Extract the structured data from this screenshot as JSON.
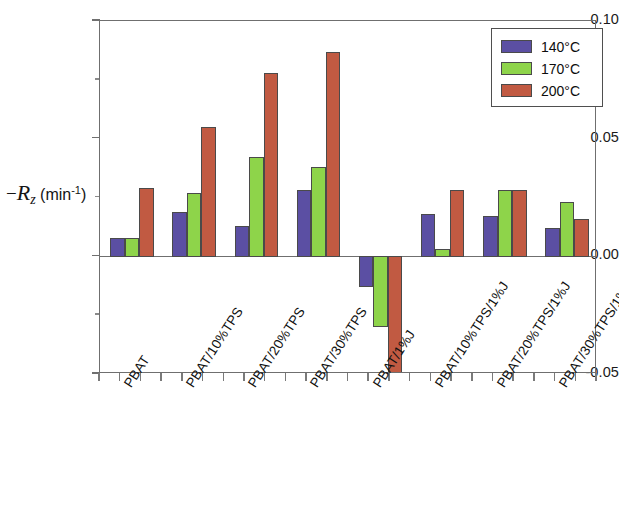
{
  "chart_data": {
    "type": "bar",
    "title": "",
    "xlabel": "",
    "ylabel": "−R_z (min⁻¹)",
    "ylim": [
      -0.05,
      0.1
    ],
    "yticks": [
      -0.05,
      0.0,
      0.05,
      0.1
    ],
    "ytick_labels": [
      "-0.05",
      "0.00",
      "0.05",
      "0.10"
    ],
    "grid": false,
    "legend_position": "top-right",
    "categories": [
      "PBAT",
      "PBAT/10%TPS",
      "PBAT/20%TPS",
      "PBAT/30%TPS",
      "PBAT/1%J",
      "PBAT/10%TPS/1%J",
      "PBAT/20%TPS/1%J",
      "PBAT/30%TPS/1%J"
    ],
    "series": [
      {
        "name": "140°C",
        "color": "#5b4fa3",
        "values": [
          0.008,
          0.019,
          0.013,
          0.028,
          -0.013,
          0.018,
          0.017,
          0.012
        ]
      },
      {
        "name": "170°C",
        "color": "#8ed44a",
        "values": [
          0.008,
          0.027,
          0.042,
          0.038,
          -0.03,
          0.003,
          0.028,
          0.023
        ]
      },
      {
        "name": "200°C",
        "color": "#c15a42",
        "values": [
          0.029,
          0.055,
          0.078,
          0.087,
          -0.062,
          0.028,
          0.028,
          0.016
        ]
      }
    ]
  },
  "axis": {
    "y_title_minus": "−",
    "y_title_symbol": "R",
    "y_title_subscript": "z",
    "y_title_units_open": " (min",
    "y_title_units_exp": "-1",
    "y_title_units_close": ")"
  },
  "legend": {
    "entries": [
      {
        "label": "140°C",
        "color": "#5b4fa3"
      },
      {
        "label": "170°C",
        "color": "#8ed44a"
      },
      {
        "label": "200°C",
        "color": "#c15a42"
      }
    ]
  }
}
